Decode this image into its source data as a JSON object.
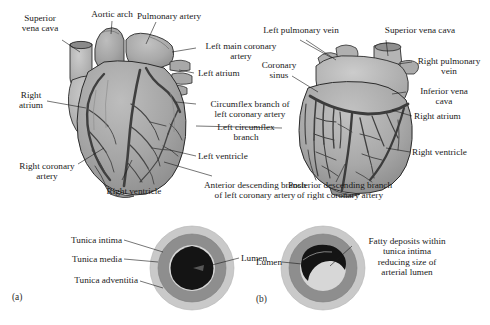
{
  "figure": {
    "panels": [
      {
        "key": "a",
        "marker": "(a)"
      },
      {
        "key": "b",
        "marker": "(b)"
      }
    ]
  },
  "heart_anterior": {
    "name": "anterior-heart-view",
    "labels": [
      {
        "id": "superior-vena-cava",
        "text": "Superior\nvena cava"
      },
      {
        "id": "aortic-arch",
        "text": "Aortic arch"
      },
      {
        "id": "pulmonary-artery",
        "text": "Pulmonary artery"
      },
      {
        "id": "left-main-coronary-artery",
        "text": "Left main coronary\nartery"
      },
      {
        "id": "left-atrium",
        "text": "Left atrium"
      },
      {
        "id": "right-atrium",
        "text": "Right\natrium"
      },
      {
        "id": "circumflex-branch-of-left-coronary-artery",
        "text": "Circumflex branch of\nleft coronary artery"
      },
      {
        "id": "left-circumflex-branch",
        "text": "Left circumflex\nbranch"
      },
      {
        "id": "left-ventricle",
        "text": "Left ventricle"
      },
      {
        "id": "right-coronary-artery",
        "text": "Right coronary\nartery"
      },
      {
        "id": "right-ventricle",
        "text": "Right ventricle"
      },
      {
        "id": "anterior-descending-branch-of-left-coronary-artery",
        "text": "Anterior descending branch\nof left coronary artery"
      }
    ]
  },
  "heart_posterior": {
    "name": "posterior-heart-view",
    "labels": [
      {
        "id": "left-pulmonary-vein",
        "text": "Left pulmonary vein"
      },
      {
        "id": "superior-vena-cava",
        "text": "Superior vena cava"
      },
      {
        "id": "right-pulmonary-vein",
        "text": "Right pulmonary\nvein"
      },
      {
        "id": "coronary-sinus",
        "text": "Coronary\nsinus"
      },
      {
        "id": "inferior-vena-cava",
        "text": "Inferior vena\ncava"
      },
      {
        "id": "right-atrium",
        "text": "Right atrium"
      },
      {
        "id": "right-ventricle",
        "text": "Right ventricle"
      },
      {
        "id": "posterior-descending-branch-of-right-coronary-artery",
        "text": "Posterior descending branch\nof right coronary artery"
      }
    ]
  },
  "cross_section_normal": {
    "name": "normal-artery-cross-section",
    "marker": "(a)",
    "labels": [
      {
        "id": "tunica-intima",
        "text": "Tunica intima"
      },
      {
        "id": "tunica-media",
        "text": "Tunica media"
      },
      {
        "id": "tunica-adventitia",
        "text": "Tunica adventitia"
      },
      {
        "id": "lumen",
        "text": "Lumen"
      }
    ],
    "colors": {
      "adventitia": "#c9c9c9",
      "media": "#8e8e8e",
      "intima": "#d7d7d7",
      "lumen": "#141414"
    }
  },
  "cross_section_diseased": {
    "name": "diseased-artery-cross-section",
    "marker": "(b)",
    "labels": [
      {
        "id": "lumen",
        "text": "Lumen"
      },
      {
        "id": "fatty-deposits",
        "text": "Fatty deposits within\ntunica intima\nreducing size of\narterial lumen"
      }
    ],
    "colors": {
      "adventitia": "#c9c9c9",
      "media": "#8e8e8e",
      "intima": "#d7d7d7",
      "lumen": "#d2d2d2",
      "plaque": "#141414"
    }
  },
  "palette": {
    "heart_muscle": "#a3a3a3",
    "heart_muscle_light": "#b8b8b8",
    "heart_vessel_dark": "#4a4a4a",
    "outline": "#2b2b2b",
    "text": "#1a1a1a",
    "background": "#ffffff"
  }
}
